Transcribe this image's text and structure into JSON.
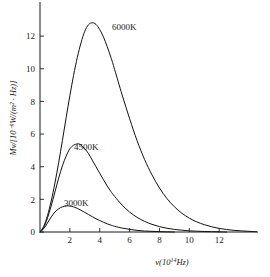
{
  "chart_data": {
    "type": "line",
    "title": "",
    "xlabel": "ν(10¹⁴Hz)",
    "ylabel": "Mν/[10⁻⁹W/(m² · Hz)]",
    "xlim": [
      0,
      14.6
    ],
    "ylim": [
      0,
      13.6
    ],
    "xticks": [
      2,
      4,
      6,
      8,
      10,
      12
    ],
    "xtick_labels": [
      "2",
      "4",
      "6",
      "8",
      "10",
      "12"
    ],
    "yticks": [
      0,
      2,
      4,
      6,
      8,
      10,
      12
    ],
    "ytick_labels": [
      "0",
      "2",
      "4",
      "6",
      "8",
      "10",
      "12"
    ],
    "grid": false,
    "legend_position": "inline-annotations",
    "series": [
      {
        "name": "6000K",
        "label": "6000K",
        "color": "#111111",
        "peak_x": 3.5,
        "peak_y": 12.8,
        "points": [
          [
            0.0,
            0.0
          ],
          [
            0.25,
            0.35
          ],
          [
            0.5,
            1.0
          ],
          [
            0.75,
            1.9
          ],
          [
            1.0,
            3.0
          ],
          [
            1.25,
            4.25
          ],
          [
            1.5,
            5.6
          ],
          [
            1.75,
            7.0
          ],
          [
            2.0,
            8.35
          ],
          [
            2.25,
            9.6
          ],
          [
            2.5,
            10.7
          ],
          [
            2.75,
            11.6
          ],
          [
            3.0,
            12.3
          ],
          [
            3.25,
            12.7
          ],
          [
            3.5,
            12.82
          ],
          [
            3.75,
            12.72
          ],
          [
            4.0,
            12.4
          ],
          [
            4.25,
            11.95
          ],
          [
            4.5,
            11.35
          ],
          [
            4.75,
            10.7
          ],
          [
            5.0,
            9.95
          ],
          [
            5.5,
            8.4
          ],
          [
            6.0,
            6.95
          ],
          [
            6.5,
            5.6
          ],
          [
            7.0,
            4.45
          ],
          [
            7.5,
            3.5
          ],
          [
            8.0,
            2.7
          ],
          [
            8.5,
            2.05
          ],
          [
            9.0,
            1.55
          ],
          [
            9.5,
            1.15
          ],
          [
            10.0,
            0.85
          ],
          [
            10.5,
            0.62
          ],
          [
            11.0,
            0.45
          ],
          [
            11.5,
            0.32
          ],
          [
            12.0,
            0.22
          ],
          [
            12.5,
            0.15
          ],
          [
            13.0,
            0.1
          ],
          [
            13.5,
            0.07
          ],
          [
            14.0,
            0.04
          ],
          [
            14.5,
            0.02
          ]
        ]
      },
      {
        "name": "4500K",
        "label": "4500K",
        "color": "#111111",
        "peak_x": 2.6,
        "peak_y": 5.4,
        "points": [
          [
            0.0,
            0.0
          ],
          [
            0.25,
            0.28
          ],
          [
            0.5,
            0.85
          ],
          [
            0.75,
            1.6
          ],
          [
            1.0,
            2.45
          ],
          [
            1.25,
            3.3
          ],
          [
            1.5,
            4.05
          ],
          [
            1.75,
            4.65
          ],
          [
            2.0,
            5.1
          ],
          [
            2.25,
            5.32
          ],
          [
            2.5,
            5.4
          ],
          [
            2.6,
            5.4
          ],
          [
            2.75,
            5.32
          ],
          [
            3.0,
            5.1
          ],
          [
            3.25,
            4.8
          ],
          [
            3.5,
            4.4
          ],
          [
            3.75,
            4.0
          ],
          [
            4.0,
            3.6
          ],
          [
            4.25,
            3.2
          ],
          [
            4.5,
            2.82
          ],
          [
            4.75,
            2.48
          ],
          [
            5.0,
            2.18
          ],
          [
            5.5,
            1.65
          ],
          [
            6.0,
            1.22
          ],
          [
            6.5,
            0.9
          ],
          [
            7.0,
            0.65
          ],
          [
            7.5,
            0.47
          ],
          [
            8.0,
            0.33
          ],
          [
            8.5,
            0.23
          ],
          [
            9.0,
            0.16
          ],
          [
            9.5,
            0.11
          ],
          [
            10.0,
            0.07
          ],
          [
            10.5,
            0.05
          ],
          [
            11.0,
            0.03
          ],
          [
            11.5,
            0.02
          ],
          [
            12.0,
            0.01
          ],
          [
            12.5,
            0.0
          ]
        ]
      },
      {
        "name": "3000K",
        "label": "3000K",
        "color": "#111111",
        "peak_x": 1.9,
        "peak_y": 1.6,
        "points": [
          [
            0.0,
            0.0
          ],
          [
            0.25,
            0.2
          ],
          [
            0.5,
            0.55
          ],
          [
            0.75,
            0.92
          ],
          [
            1.0,
            1.22
          ],
          [
            1.25,
            1.42
          ],
          [
            1.5,
            1.54
          ],
          [
            1.75,
            1.59
          ],
          [
            1.9,
            1.6
          ],
          [
            2.0,
            1.59
          ],
          [
            2.25,
            1.54
          ],
          [
            2.5,
            1.45
          ],
          [
            2.75,
            1.33
          ],
          [
            3.0,
            1.2
          ],
          [
            3.25,
            1.07
          ],
          [
            3.5,
            0.94
          ],
          [
            3.75,
            0.81
          ],
          [
            4.0,
            0.7
          ],
          [
            4.25,
            0.6
          ],
          [
            4.5,
            0.5
          ],
          [
            4.75,
            0.42
          ],
          [
            5.0,
            0.35
          ],
          [
            5.5,
            0.24
          ],
          [
            6.0,
            0.16
          ],
          [
            6.5,
            0.1
          ],
          [
            7.0,
            0.06
          ],
          [
            7.5,
            0.04
          ],
          [
            8.0,
            0.02
          ],
          [
            8.5,
            0.01
          ],
          [
            9.0,
            0.0
          ]
        ]
      }
    ],
    "annotations": [
      {
        "text": "6000K",
        "x_px": 112,
        "y_px": 30
      },
      {
        "text": "4500K",
        "x_px": 74,
        "y_px": 150
      },
      {
        "text": "3000K",
        "x_px": 64,
        "y_px": 206
      }
    ]
  },
  "axis": {
    "x_title_base": "ν(10",
    "x_title_exp": "14",
    "x_title_tail": "Hz)",
    "y_title_full": "Mν/[10⁻⁹W/(m² · Hz)]"
  }
}
